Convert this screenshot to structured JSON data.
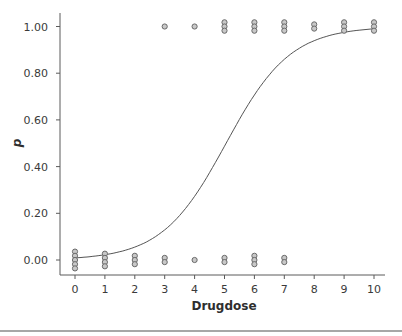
{
  "chart_data": {
    "type": "scatter",
    "title": "",
    "xlabel": "Drugdose",
    "ylabel": "p",
    "xlim": [
      0,
      10
    ],
    "ylim": [
      0.0,
      1.0
    ],
    "x_ticks": [
      "0",
      "1",
      "2",
      "3",
      "4",
      "5",
      "6",
      "7",
      "8",
      "9",
      "10"
    ],
    "y_ticks": [
      "0.00",
      "0.20",
      "0.40",
      "0.60",
      "0.80",
      "1.00"
    ],
    "grid": false,
    "legend": null,
    "series": [
      {
        "name": "observed outcomes (0)",
        "points": [
          {
            "x": 0,
            "y": 0.0
          },
          {
            "x": 0,
            "y": 0.0
          },
          {
            "x": 0,
            "y": 0.0
          },
          {
            "x": 0,
            "y": 0.0
          },
          {
            "x": 0,
            "y": 0.0
          },
          {
            "x": 1,
            "y": 0.0
          },
          {
            "x": 1,
            "y": 0.0
          },
          {
            "x": 1,
            "y": 0.0
          },
          {
            "x": 1,
            "y": 0.0
          },
          {
            "x": 2,
            "y": 0.0
          },
          {
            "x": 2,
            "y": 0.0
          },
          {
            "x": 2,
            "y": 0.0
          },
          {
            "x": 3,
            "y": 0.0
          },
          {
            "x": 3,
            "y": 0.0
          },
          {
            "x": 4,
            "y": 0.0
          },
          {
            "x": 5,
            "y": 0.0
          },
          {
            "x": 5,
            "y": 0.0
          },
          {
            "x": 6,
            "y": 0.0
          },
          {
            "x": 6,
            "y": 0.0
          },
          {
            "x": 6,
            "y": 0.0
          },
          {
            "x": 7,
            "y": 0.0
          },
          {
            "x": 7,
            "y": 0.0
          }
        ]
      },
      {
        "name": "observed outcomes (1)",
        "points": [
          {
            "x": 3,
            "y": 1.0
          },
          {
            "x": 4,
            "y": 1.0
          },
          {
            "x": 5,
            "y": 1.0
          },
          {
            "x": 5,
            "y": 1.0
          },
          {
            "x": 5,
            "y": 1.0
          },
          {
            "x": 6,
            "y": 1.0
          },
          {
            "x": 6,
            "y": 1.0
          },
          {
            "x": 6,
            "y": 1.0
          },
          {
            "x": 7,
            "y": 1.0
          },
          {
            "x": 7,
            "y": 1.0
          },
          {
            "x": 7,
            "y": 1.0
          },
          {
            "x": 8,
            "y": 1.0
          },
          {
            "x": 8,
            "y": 1.0
          },
          {
            "x": 9,
            "y": 1.0
          },
          {
            "x": 9,
            "y": 1.0
          },
          {
            "x": 9,
            "y": 1.0
          },
          {
            "x": 10,
            "y": 1.0
          },
          {
            "x": 10,
            "y": 1.0
          },
          {
            "x": 10,
            "y": 1.0
          }
        ]
      },
      {
        "name": "fitted logistic curve",
        "type": "line",
        "x": [
          0,
          1,
          2,
          3,
          4,
          5,
          6,
          7,
          8,
          9,
          10
        ],
        "values": [
          0.01,
          0.02,
          0.06,
          0.14,
          0.3,
          0.52,
          0.73,
          0.87,
          0.94,
          0.97,
          0.99
        ]
      }
    ]
  }
}
